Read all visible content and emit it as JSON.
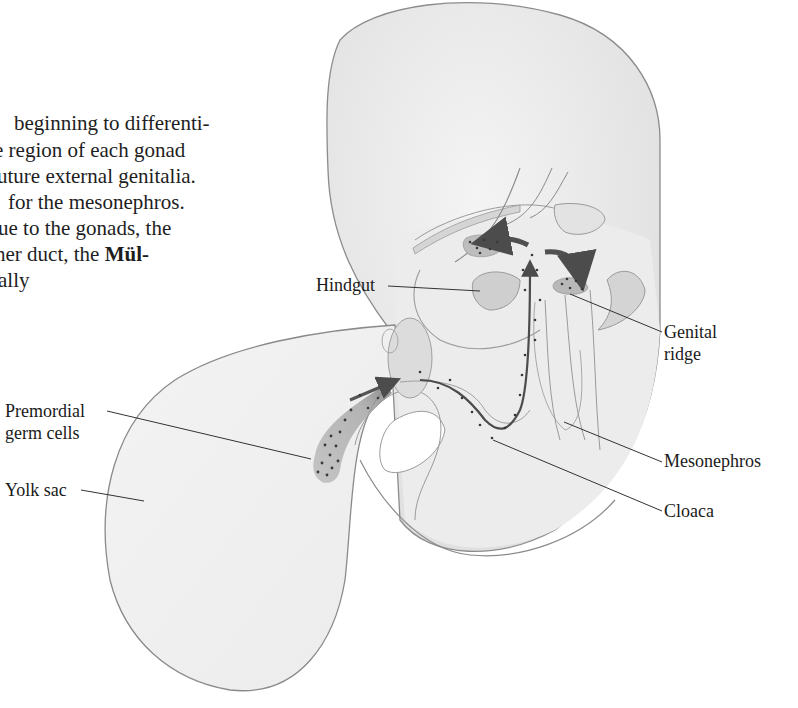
{
  "body_text": {
    "lines": [
      {
        "text": "beginning to differenti-",
        "bold_tail": ""
      },
      {
        "text": "e region of each gonad",
        "bold_tail": ""
      },
      {
        "text": "uture external genitalia.",
        "bold_tail": ""
      },
      {
        "text": "for the mesonephros.",
        "bold_tail": ""
      },
      {
        "text": "ue to the gonads, the",
        "bold_tail": ""
      },
      {
        "text": "her duct, the ",
        "bold_tail": "Mül-"
      },
      {
        "text": "ally",
        "bold_tail": ""
      }
    ]
  },
  "figure": {
    "labels": {
      "hindgut": "Hindgut",
      "genital_ridge_1": "Genital",
      "genital_ridge_2": "ridge",
      "premordial_1": "Premordial",
      "premordial_2": "germ cells",
      "mesonephros": "Mesonephros",
      "yolk_sac": "Yolk sac",
      "cloaca": "Cloaca"
    },
    "colors": {
      "fill_light": "#efefef",
      "fill_mid": "#d8d8d8",
      "outline": "#8a8a8a",
      "arrow": "#555555",
      "dots": "#3a3a3a"
    }
  }
}
